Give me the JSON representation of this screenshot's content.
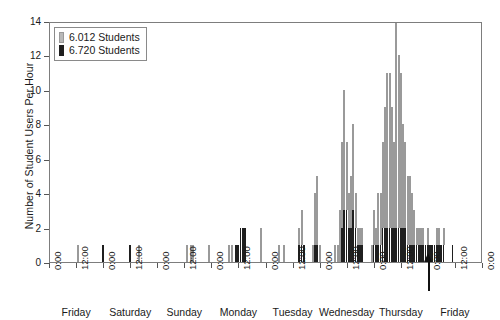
{
  "chart_data": {
    "type": "bar",
    "title": "",
    "subtitle": "",
    "xlabel": "",
    "ylabel": "Number of Student Users Per Hour",
    "ylim": [
      0,
      14
    ],
    "yticks": [
      0,
      2,
      4,
      6,
      8,
      10,
      12,
      14
    ],
    "grid": false,
    "stacked": true,
    "legend_position": "top-left",
    "x_axis": {
      "unit": "hour",
      "total_hours": 192,
      "tick_interval_hours": 12,
      "tick_labels": [
        "0:00",
        "12:00",
        "0:00",
        "12:00",
        "0:00",
        "12:00",
        "0:00",
        "12:00",
        "0:00",
        "12:00",
        "0:00",
        "12:00",
        "0:00",
        "12:00",
        "0:00",
        "12:00",
        "0:00"
      ],
      "day_labels": [
        "Friday",
        "Saturday",
        "Sunday",
        "Monday",
        "Tuesday",
        "Wednesday",
        "Thursday",
        "Friday"
      ]
    },
    "colors": {
      "series_6012": "#b9b9b9",
      "series_6720": "#1f1f1f",
      "axis": "#7d7d7d",
      "text": "#1a1a1a"
    },
    "annotations": [
      {
        "type": "arrow",
        "label": "",
        "x_hour": 168,
        "direction": "up",
        "color": "#111111"
      }
    ],
    "series": [
      {
        "name": "6.012 Students",
        "color": "#b9b9b9",
        "values": [
          0,
          0,
          0,
          0,
          0,
          0,
          0,
          0,
          0,
          0,
          0,
          0,
          1,
          0,
          0,
          0,
          0,
          0,
          0,
          0,
          0,
          0,
          0,
          0,
          0,
          0,
          0,
          0,
          0,
          0,
          0,
          0,
          0,
          0,
          0,
          0,
          0,
          0,
          0,
          1,
          0,
          0,
          0,
          0,
          0,
          0,
          0,
          0,
          0,
          0,
          0,
          0,
          0,
          0,
          0,
          0,
          0,
          0,
          0,
          0,
          1,
          0,
          1,
          1,
          0,
          0,
          0,
          0,
          0,
          0,
          1,
          0,
          0,
          0,
          0,
          0,
          0,
          0,
          0,
          1,
          1,
          0,
          0,
          0,
          0,
          0,
          0,
          0,
          0,
          0,
          0,
          0,
          0,
          2,
          0,
          0,
          0,
          0,
          0,
          0,
          0,
          1,
          0,
          1,
          0,
          0,
          0,
          0,
          0,
          0,
          1,
          2,
          0,
          0,
          0,
          0,
          1,
          3,
          4,
          1,
          0,
          0,
          0,
          0,
          0,
          0,
          1,
          1,
          3,
          5,
          7,
          4,
          2,
          3,
          5,
          2,
          1,
          1,
          1,
          0,
          0,
          0,
          1,
          2,
          1,
          3,
          3,
          5,
          7,
          9,
          9,
          7,
          5,
          13,
          10,
          9,
          6,
          5,
          4,
          4,
          3,
          2,
          1,
          1,
          1,
          1,
          0,
          1,
          0,
          0,
          0,
          1,
          1,
          0,
          1,
          0,
          0,
          0,
          0,
          0,
          0,
          0,
          0,
          0,
          0,
          0,
          0,
          0,
          0,
          0,
          0,
          0
        ]
      },
      {
        "name": "6.720 Students",
        "color": "#1f1f1f",
        "values": [
          0,
          0,
          0,
          0,
          0,
          0,
          0,
          0,
          0,
          0,
          0,
          0,
          0,
          0,
          0,
          0,
          0,
          0,
          0,
          0,
          0,
          0,
          0,
          1,
          0,
          0,
          0,
          0,
          0,
          0,
          0,
          0,
          0,
          0,
          0,
          1,
          0,
          0,
          0,
          0,
          0,
          0,
          0,
          0,
          0,
          0,
          0,
          0,
          0,
          0,
          0,
          0,
          0,
          0,
          0,
          0,
          0,
          0,
          0,
          0,
          0,
          0,
          0,
          0,
          0,
          0,
          0,
          0,
          0,
          0,
          0,
          0,
          0,
          0,
          0,
          0,
          0,
          0,
          0,
          0,
          0,
          0,
          1,
          1,
          2,
          2,
          2,
          0,
          0,
          0,
          0,
          0,
          0,
          0,
          0,
          0,
          0,
          0,
          0,
          0,
          0,
          0,
          0,
          0,
          0,
          0,
          0,
          0,
          0,
          0,
          1,
          1,
          1,
          0,
          0,
          0,
          0,
          1,
          1,
          0,
          0,
          0,
          0,
          0,
          0,
          0,
          0,
          0,
          0,
          2,
          3,
          3,
          2,
          2,
          3,
          2,
          1,
          1,
          1,
          0,
          0,
          0,
          0,
          1,
          1,
          1,
          1,
          2,
          2,
          2,
          2,
          2,
          2,
          2,
          2,
          2,
          2,
          2,
          1,
          1,
          1,
          1,
          1,
          1,
          1,
          1,
          1,
          1,
          1,
          1,
          1,
          1,
          1,
          1,
          1,
          0,
          0,
          0,
          1,
          0,
          0,
          0,
          0,
          0,
          0,
          0,
          0,
          0,
          0,
          0,
          0,
          0
        ]
      }
    ]
  },
  "legend": {
    "items": [
      {
        "label": "6.012 Students",
        "swatch": "light-gray"
      },
      {
        "label": "6.720 Students",
        "swatch": "black"
      }
    ]
  }
}
